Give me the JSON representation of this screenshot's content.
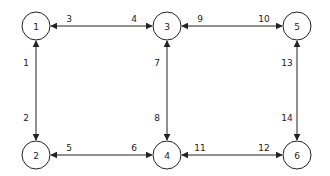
{
  "diagram": {
    "nodes": [
      {
        "id": "1",
        "label": "1",
        "x": 36,
        "y": 26
      },
      {
        "id": "3",
        "label": "3",
        "x": 167,
        "y": 26
      },
      {
        "id": "5",
        "label": "5",
        "x": 297,
        "y": 26
      },
      {
        "id": "2",
        "label": "2",
        "x": 36,
        "y": 155
      },
      {
        "id": "4",
        "label": "4",
        "x": 167,
        "y": 155
      },
      {
        "id": "6",
        "label": "6",
        "x": 297,
        "y": 155
      }
    ],
    "edges": [
      {
        "from": "1",
        "to": "3",
        "direction": "bidirectional",
        "label_near_from": "3",
        "label_near_to": "4"
      },
      {
        "from": "3",
        "to": "5",
        "direction": "bidirectional",
        "label_near_from": "9",
        "label_near_to": "10"
      },
      {
        "from": "2",
        "to": "4",
        "direction": "bidirectional",
        "label_near_from": "5",
        "label_near_to": "6"
      },
      {
        "from": "4",
        "to": "6",
        "direction": "bidirectional",
        "label_near_from": "11",
        "label_near_to": "12"
      },
      {
        "from": "1",
        "to": "2",
        "direction": "bidirectional",
        "label_near_from": "1",
        "label_near_to": "2"
      },
      {
        "from": "3",
        "to": "4",
        "direction": "bidirectional",
        "label_near_from": "7",
        "label_near_to": "8"
      },
      {
        "from": "5",
        "to": "6",
        "direction": "bidirectional",
        "label_near_from": "13",
        "label_near_to": "14"
      }
    ],
    "colors": {
      "stroke": "#222222",
      "background": "#ffffff"
    }
  }
}
